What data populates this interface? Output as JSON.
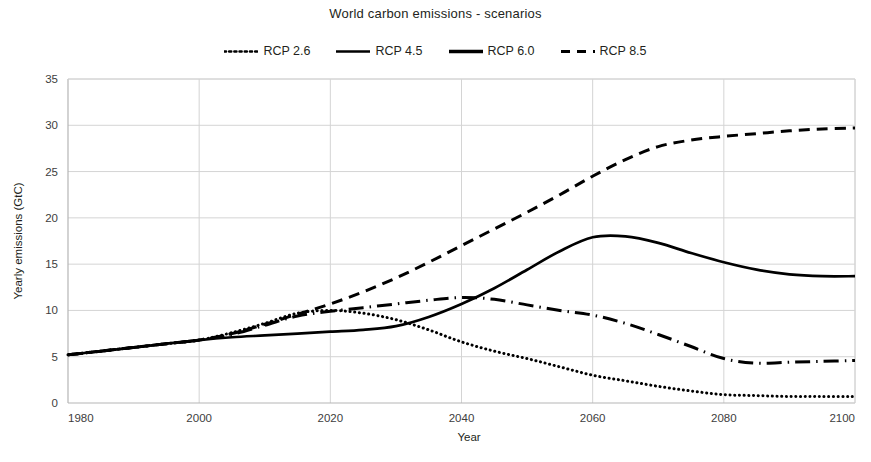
{
  "chart_data": {
    "type": "line",
    "title": "World carbon emissions - scenarios",
    "xlabel": "Year",
    "ylabel": "Yearly emissions (GtC)",
    "xlim": [
      1980,
      2100
    ],
    "ylim": [
      0,
      35
    ],
    "xticks": [
      1980,
      2000,
      2020,
      2040,
      2060,
      2080,
      2100
    ],
    "yticks": [
      0,
      5,
      10,
      15,
      20,
      25,
      30,
      35
    ],
    "grid": true,
    "legend_position": "top-center",
    "line_color": "#000000",
    "x": [
      1980,
      1985,
      1990,
      1995,
      2000,
      2005,
      2010,
      2015,
      2020,
      2025,
      2030,
      2035,
      2040,
      2045,
      2050,
      2055,
      2060,
      2065,
      2070,
      2075,
      2080,
      2085,
      2090,
      2095,
      2100
    ],
    "series": [
      {
        "name": "RCP 2.6",
        "style": "dotted",
        "values": [
          5.2,
          5.6,
          6.0,
          6.4,
          6.8,
          7.6,
          8.6,
          9.7,
          10.0,
          9.7,
          9.0,
          7.9,
          6.6,
          5.6,
          4.8,
          3.9,
          3.0,
          2.4,
          1.8,
          1.3,
          0.9,
          0.8,
          0.7,
          0.7,
          0.7
        ]
      },
      {
        "name": "RCP 4.5",
        "style": "solid",
        "values": [
          5.2,
          5.6,
          6.0,
          6.4,
          6.8,
          7.1,
          7.3,
          7.5,
          7.7,
          7.9,
          8.3,
          9.3,
          10.7,
          12.4,
          14.4,
          16.4,
          17.9,
          18.0,
          17.3,
          16.2,
          15.2,
          14.4,
          13.9,
          13.7,
          13.7
        ]
      },
      {
        "name": "RCP 6.0",
        "style": "dashdot",
        "values": [
          5.2,
          5.6,
          6.0,
          6.4,
          6.8,
          7.4,
          8.4,
          9.4,
          9.9,
          10.3,
          10.7,
          11.1,
          11.4,
          11.2,
          10.6,
          10.0,
          9.5,
          8.6,
          7.4,
          6.1,
          4.8,
          4.3,
          4.4,
          4.5,
          4.6
        ]
      },
      {
        "name": "RCP 8.5",
        "style": "dashed",
        "values": [
          5.2,
          5.6,
          6.0,
          6.4,
          6.8,
          7.5,
          8.5,
          9.6,
          10.7,
          12.0,
          13.5,
          15.2,
          17.0,
          18.8,
          20.6,
          22.5,
          24.5,
          26.3,
          27.7,
          28.4,
          28.8,
          29.1,
          29.4,
          29.6,
          29.7
        ]
      }
    ]
  },
  "legend": {
    "entries": [
      {
        "label": "RCP 2.6",
        "style": "dotted"
      },
      {
        "label": "RCP 4.5",
        "style": "solid"
      },
      {
        "label": "RCP 6.0",
        "style": "solid-thick"
      },
      {
        "label": "RCP 8.5",
        "style": "dashed"
      }
    ]
  }
}
